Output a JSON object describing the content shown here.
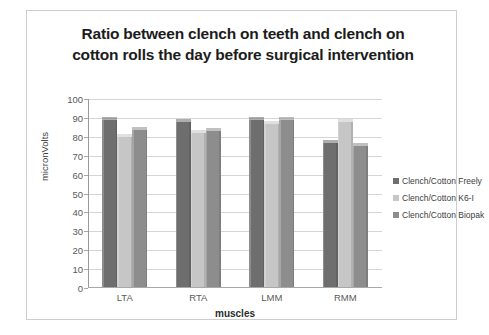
{
  "chart_data": {
    "type": "bar",
    "title": "Ratio between clench on teeth and clench on cotton rolls the day before surgical intervention",
    "title_lines": [
      "Ratio between clench on teeth and clench on",
      "cotton rolls the day before surgical intervention"
    ],
    "xlabel": "muscles",
    "ylabel": "micronVolts",
    "categories": [
      "LTA",
      "RTA",
      "LMM",
      "RMM"
    ],
    "ylim": [
      0,
      100
    ],
    "yticks": [
      0,
      10,
      20,
      30,
      40,
      50,
      60,
      70,
      80,
      90,
      100
    ],
    "grid": true,
    "legend_position": "right",
    "series": [
      {
        "name": "Clench/Cotton Freely",
        "color": "#6e6e6e",
        "values": [
          90,
          89,
          90,
          78
        ]
      },
      {
        "name": "Clench/Cotton K6-I",
        "color": "#c6c6c6",
        "values": [
          81,
          83,
          88,
          89
        ]
      },
      {
        "name": "Clench/Cotton Biopak",
        "color": "#8d8d8d",
        "values": [
          84.5,
          84,
          90,
          76
        ]
      }
    ]
  },
  "colors": {
    "frame_border": "#cdcdcd",
    "gridline": "#d5d5d5",
    "axis": "#9a9a9a",
    "tick_text": "#59595a",
    "title_text": "#1c1c1c"
  }
}
